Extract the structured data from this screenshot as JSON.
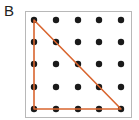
{
  "figure": {
    "label": "B",
    "colors": {
      "border": "#b8b8b8",
      "dot": "#1a1a1a",
      "shape": "#d9652f"
    },
    "grid": {
      "rows": 5,
      "cols": 5,
      "x": [
        34,
        56,
        78,
        99,
        121
      ],
      "y": [
        20,
        42,
        64,
        87,
        109
      ]
    },
    "shape": {
      "type": "right-triangle",
      "vertices": [
        [
          0,
          0
        ],
        [
          0,
          4
        ],
        [
          4,
          4
        ]
      ]
    }
  }
}
